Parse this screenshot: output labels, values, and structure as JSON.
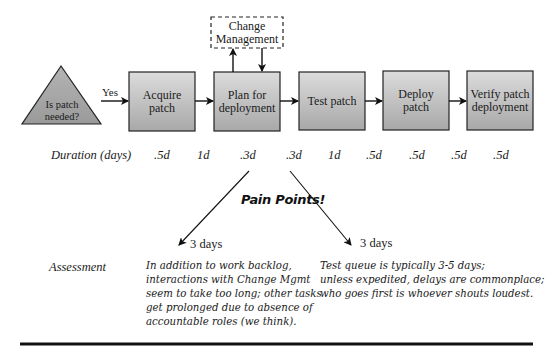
{
  "diagram": {
    "decision": {
      "label_line1": "Is patch",
      "label_line2": "needed?",
      "yes_label": "Yes"
    },
    "change_management": {
      "line1": "Change",
      "line2": "Management"
    },
    "steps": [
      {
        "line1": "Acquire",
        "line2": "patch"
      },
      {
        "line1": "Plan for",
        "line2": "deployment"
      },
      {
        "line1": "Test patch",
        "line2": ""
      },
      {
        "line1": "Deploy",
        "line2": "patch"
      },
      {
        "line1": "Verify patch",
        "line2": "deployment"
      }
    ],
    "duration": {
      "label": "Duration (days)",
      "values": [
        ".5d",
        "1d",
        ".3d",
        ".3d",
        "1d",
        ".5d",
        ".5d",
        ".5d",
        ".5d"
      ]
    },
    "pain_points": {
      "title": "Pain Points!",
      "left": {
        "days": "3 days",
        "lines": [
          "In addition to work backlog,",
          "interactions with Change Mgmt",
          "seem to take too long; other tasks",
          "get prolonged due to absence of",
          "accountable roles (we think)."
        ]
      },
      "right": {
        "days": "3 days",
        "lines": [
          "Test queue is typically 3-5 days;",
          "unless expedited, delays are commonplace;",
          "who goes first is whoever shouts loudest."
        ]
      }
    },
    "assessment_label": "Assessment",
    "colors": {
      "box_fill_top": "#d9d9d9",
      "box_fill_bottom": "#a9a9a9",
      "triangle_fill": "#a6a6a6",
      "stroke": "#222222"
    }
  }
}
